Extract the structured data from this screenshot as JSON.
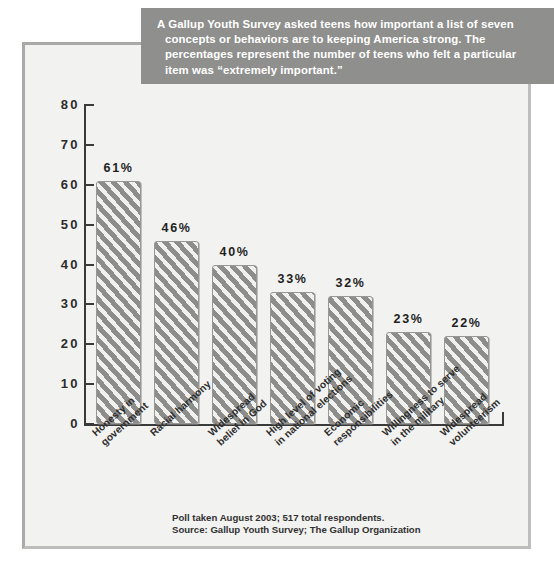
{
  "caption": {
    "text": "A Gallup Youth Survey asked teens how important a list of seven concepts or behaviors are to keeping America strong. The percentages represent the number of teens who felt a particular item was “extremely important.”",
    "background_color": "#8f8f8d",
    "text_color": "#ffffff"
  },
  "footnote": {
    "line1": "Poll taken August 2003; 517 total respondents.",
    "line2": "Source: Gallup Youth Survey; The Gallup Organization"
  },
  "colors": {
    "bar_fill": "#8d8d8b",
    "bar_hatch": "#f6f6f4",
    "frame": "#a9a9a7",
    "plot_background": "#f2f2f0",
    "axis": "#3a3a3a"
  },
  "chart_data": {
    "type": "bar",
    "title": "",
    "xlabel": "",
    "ylabel": "",
    "ylim": [
      0,
      80
    ],
    "yticks": [
      0,
      10,
      20,
      30,
      40,
      50,
      60,
      70,
      80
    ],
    "ytick_labels": [
      "0",
      "10",
      "20",
      "30",
      "40",
      "50",
      "60",
      "70",
      "80"
    ],
    "grid": false,
    "legend": "none",
    "value_suffix": "%",
    "categories": [
      "Honesty in\ngovernment",
      "Racial harmony",
      "Widespread\nbelief in God",
      "High level of voting\nin national elections",
      "Economic\nresponsibilities",
      "Willingness to serve\nin the military",
      "Widespread\nvolunteerism"
    ],
    "values": [
      61,
      46,
      40,
      33,
      32,
      23,
      22
    ],
    "value_labels": [
      "61%",
      "46%",
      "40%",
      "33%",
      "32%",
      "23%",
      "22%"
    ]
  }
}
